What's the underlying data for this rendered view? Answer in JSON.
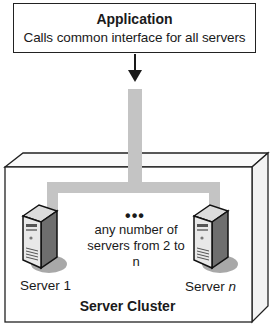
{
  "application": {
    "title": "Application",
    "subtitle": "Calls common interface for all servers"
  },
  "cluster": {
    "title": "Server Cluster",
    "dots": "•••",
    "note_line1": "any number of",
    "note_line2": "servers from 2 to n",
    "servers": [
      {
        "label": "Server 1"
      },
      {
        "label_prefix": "Server ",
        "label_italic": "n"
      }
    ]
  },
  "colors": {
    "pipe": "#c4c4c4",
    "border": "#222222",
    "shadow": "#a8a8a8"
  }
}
